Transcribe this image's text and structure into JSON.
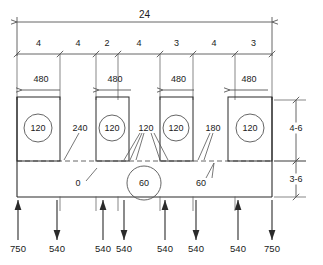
{
  "drawing": {
    "title": "structural-beam-loading-diagram",
    "units_note": "",
    "colors": {
      "line": "#555555",
      "heavy_line": "#2b2b2b",
      "text": "#1a1a1a",
      "background": "#ffffff"
    }
  },
  "overall_dimension": {
    "label": "24",
    "x_start": 17,
    "x_end": 272,
    "y": 22
  },
  "dimension_chain": {
    "y": 54,
    "label_y": 46,
    "segments": [
      {
        "label": "4",
        "x_start": 17,
        "x_end": 60
      },
      {
        "label": "4",
        "x_start": 60,
        "x_end": 96
      },
      {
        "label": "2",
        "x_start": 96,
        "x_end": 118
      },
      {
        "label": "4",
        "x_start": 118,
        "x_end": 160
      },
      {
        "label": "3",
        "x_start": 160,
        "x_end": 193
      },
      {
        "label": "4",
        "x_start": 193,
        "x_end": 235
      },
      {
        "label": "3",
        "x_start": 235,
        "x_end": 272
      }
    ]
  },
  "column_dimensions": {
    "label_y": 82,
    "line_y": 90,
    "items": [
      {
        "label": "480",
        "x_start": 22,
        "x_end": 60
      },
      {
        "label": "480",
        "x_start": 99,
        "x_end": 131
      },
      {
        "label": "480",
        "x_start": 163,
        "x_end": 194
      },
      {
        "label": "480",
        "x_start": 230,
        "x_end": 268
      }
    ]
  },
  "columns": [
    {
      "label": "120",
      "x": 17,
      "width": 43,
      "y": 97,
      "height": 64,
      "circle_cx": 38,
      "circle_cy": 128,
      "circle_r": 14
    },
    {
      "label": "120",
      "x": 96,
      "width": 33,
      "y": 97,
      "height": 64,
      "circle_cx": 112,
      "circle_cy": 128,
      "circle_r": 13
    },
    {
      "label": "120",
      "x": 160,
      "width": 33,
      "y": 97,
      "height": 64,
      "circle_cx": 176,
      "circle_cy": 128,
      "circle_r": 13
    },
    {
      "label": "120",
      "x": 228,
      "width": 44,
      "y": 97,
      "height": 64,
      "circle_cx": 250,
      "circle_cy": 128,
      "circle_r": 14
    }
  ],
  "slab": {
    "x": 17,
    "y": 161,
    "width": 255,
    "height": 36,
    "dashed_line_y": 161,
    "bottom_line_y": 197,
    "center_circle": {
      "label": "60",
      "cx": 144,
      "cy": 183,
      "r": 17
    }
  },
  "callouts": [
    {
      "label": "240",
      "x": 80,
      "y": 128,
      "anchor": "middle",
      "name": "callout-240"
    },
    {
      "label": "120",
      "x": 146,
      "y": 128,
      "anchor": "middle",
      "name": "callout-120-mid"
    },
    {
      "label": "180",
      "x": 213,
      "y": 128,
      "anchor": "middle",
      "name": "callout-180"
    },
    {
      "label": "0",
      "x": 78,
      "y": 183,
      "anchor": "middle",
      "name": "callout-0"
    },
    {
      "label": "60",
      "x": 201,
      "y": 183,
      "anchor": "middle",
      "name": "callout-60-right"
    }
  ],
  "side_dimensions": {
    "x": 296,
    "items": [
      {
        "label": "4-6",
        "y_start": 100,
        "y_end": 161,
        "label_y": 131
      },
      {
        "label": "3-6",
        "y_start": 161,
        "y_end": 197,
        "label_y": 182
      }
    ]
  },
  "load_arrows": {
    "label_y": 252,
    "items": [
      {
        "label": "750",
        "x": 18,
        "direction": "up",
        "top": 200,
        "bottom": 240
      },
      {
        "label": "540",
        "x": 57,
        "direction": "down",
        "top": 200,
        "bottom": 240
      },
      {
        "label": "540",
        "x": 103,
        "direction": "up",
        "top": 200,
        "bottom": 240
      },
      {
        "label": "540",
        "x": 124,
        "direction": "down",
        "top": 200,
        "bottom": 240
      },
      {
        "label": "540",
        "x": 165,
        "direction": "up",
        "top": 200,
        "bottom": 240
      },
      {
        "label": "540",
        "x": 196,
        "direction": "down",
        "top": 200,
        "bottom": 240
      },
      {
        "label": "540",
        "x": 238,
        "direction": "up",
        "top": 200,
        "bottom": 240
      },
      {
        "label": "750",
        "x": 272,
        "direction": "down",
        "top": 200,
        "bottom": 240
      }
    ]
  }
}
